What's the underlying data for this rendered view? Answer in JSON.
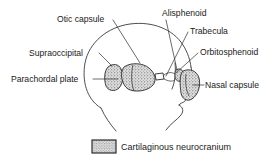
{
  "figure": {
    "colors": {
      "background": "#ffffff",
      "ink": "#1a1a1a",
      "outline": "#3a3a3a",
      "leader": "#2b2b2b",
      "stipple_fill": "#d9d9d9",
      "stipple_dot": "#555555"
    }
  },
  "labels": [
    {
      "id": "otic-capsule",
      "text": "Otic capsule",
      "x": 57,
      "y": 22,
      "anchor": "start"
    },
    {
      "id": "alisphenoid",
      "text": "Alisphenoid",
      "x": 162,
      "y": 16,
      "anchor": "start"
    },
    {
      "id": "trabecula",
      "text": "Trabecula",
      "x": 190,
      "y": 34,
      "anchor": "start"
    },
    {
      "id": "supraoccipital",
      "text": "Supraoccipital",
      "x": 29,
      "y": 56,
      "anchor": "start"
    },
    {
      "id": "orbitosphenoid",
      "text": "Orbitosphenoid",
      "x": 200,
      "y": 55,
      "anchor": "start"
    },
    {
      "id": "parachordal-plate",
      "text": "Parachordal plate",
      "x": 11,
      "y": 82,
      "anchor": "start"
    },
    {
      "id": "nasal-capsule",
      "text": "Nasal capsule",
      "x": 205,
      "y": 88,
      "anchor": "start"
    }
  ],
  "legend": {
    "swatch_label": "stipple-swatch",
    "text": "Cartilaginous neurocranium",
    "swatch": {
      "x": 92,
      "y": 140,
      "width": 24,
      "height": 13
    },
    "text_x": 121,
    "text_y": 150
  },
  "structures": [
    {
      "id": "supraoccipital-mass",
      "name": "Supraoccipital cartilage"
    },
    {
      "id": "otic-capsule-mass",
      "name": "Otic capsule / parachordal plate"
    },
    {
      "id": "alisphenoid-mass",
      "name": "Alisphenoid"
    },
    {
      "id": "nasal-capsule-mass",
      "name": "Nasal capsule"
    },
    {
      "id": "trabecula-strand",
      "name": "Trabecula"
    }
  ]
}
